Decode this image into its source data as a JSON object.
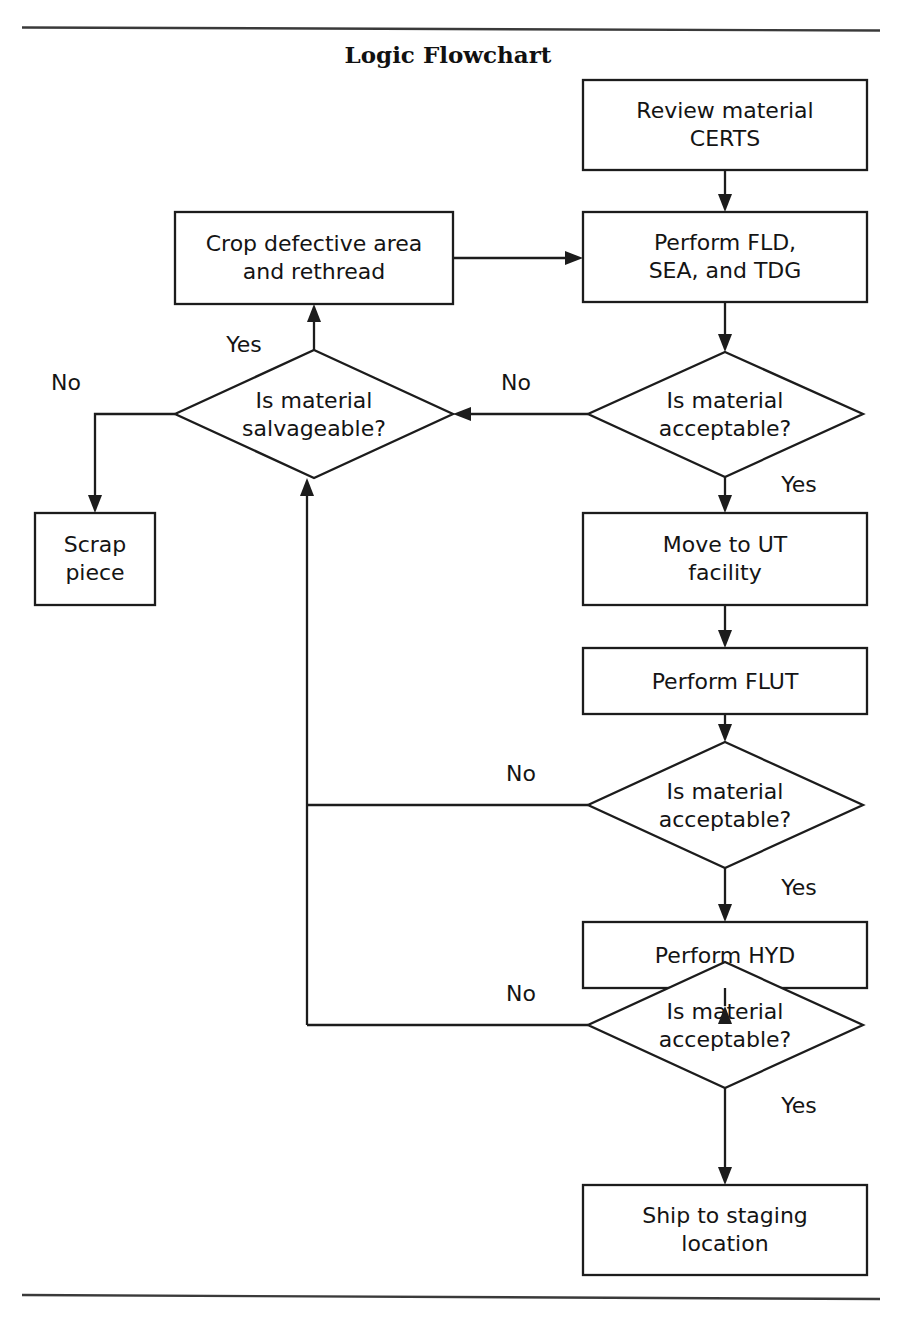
{
  "figure": {
    "title": "Logic Flowchart",
    "type": "flowchart",
    "width": 897,
    "height": 1323,
    "background_color": "#ffffff",
    "line_color": "#1c1c1c",
    "text_color": "#141414",
    "top_rule": true,
    "bottom_rule": true
  },
  "nodes": [
    {
      "id": "review_certs",
      "shape": "process",
      "line1": "Review material",
      "line2": "CERTS"
    },
    {
      "id": "crop_rethread",
      "shape": "process",
      "line1": "Crop defective area",
      "line2": "and rethread"
    },
    {
      "id": "perform_fld",
      "shape": "process",
      "line1": "Perform FLD,",
      "line2": "SEA, and TDG"
    },
    {
      "id": "salvageable",
      "shape": "decision",
      "line1": "Is material",
      "line2": "salvageable?"
    },
    {
      "id": "acceptable_1",
      "shape": "decision",
      "line1": "Is material",
      "line2": "acceptable?"
    },
    {
      "id": "scrap_piece",
      "shape": "process",
      "line1": "Scrap",
      "line2": "piece"
    },
    {
      "id": "move_ut",
      "shape": "process",
      "line1": "Move to UT",
      "line2": "facility"
    },
    {
      "id": "perform_flut",
      "shape": "process",
      "line1": "Perform FLUT",
      "line2": ""
    },
    {
      "id": "acceptable_2",
      "shape": "decision",
      "line1": "Is material",
      "line2": "acceptable?"
    },
    {
      "id": "perform_hyd",
      "shape": "process",
      "line1": "Perform HYD",
      "line2": ""
    },
    {
      "id": "acceptable_3",
      "shape": "decision",
      "line1": "Is material",
      "line2": "acceptable?"
    },
    {
      "id": "ship_staging",
      "shape": "process",
      "line1": "Ship to staging",
      "line2": "location"
    }
  ],
  "edge_labels": {
    "salvageable_yes": "Yes",
    "salvageable_no": "No",
    "acceptable_1_no": "No",
    "acceptable_1_yes": "Yes",
    "acceptable_2_no": "No",
    "acceptable_2_yes": "Yes",
    "acceptable_3_no": "No",
    "acceptable_3_yes": "Yes"
  },
  "edges": [
    {
      "from": "review_certs",
      "to": "perform_fld",
      "label": ""
    },
    {
      "from": "crop_rethread",
      "to": "perform_fld",
      "label": ""
    },
    {
      "from": "perform_fld",
      "to": "acceptable_1",
      "label": ""
    },
    {
      "from": "acceptable_1",
      "to": "salvageable",
      "label": "No"
    },
    {
      "from": "acceptable_1",
      "to": "move_ut",
      "label": "Yes"
    },
    {
      "from": "salvageable",
      "to": "crop_rethread",
      "label": "Yes"
    },
    {
      "from": "salvageable",
      "to": "scrap_piece",
      "label": "No"
    },
    {
      "from": "move_ut",
      "to": "perform_flut",
      "label": ""
    },
    {
      "from": "perform_flut",
      "to": "acceptable_2",
      "label": ""
    },
    {
      "from": "acceptable_2",
      "to": "salvageable",
      "label": "No"
    },
    {
      "from": "acceptable_2",
      "to": "perform_hyd",
      "label": "Yes"
    },
    {
      "from": "perform_hyd",
      "to": "acceptable_3",
      "label": ""
    },
    {
      "from": "acceptable_3",
      "to": "salvageable",
      "label": "No"
    },
    {
      "from": "acceptable_3",
      "to": "ship_staging",
      "label": "Yes"
    }
  ]
}
